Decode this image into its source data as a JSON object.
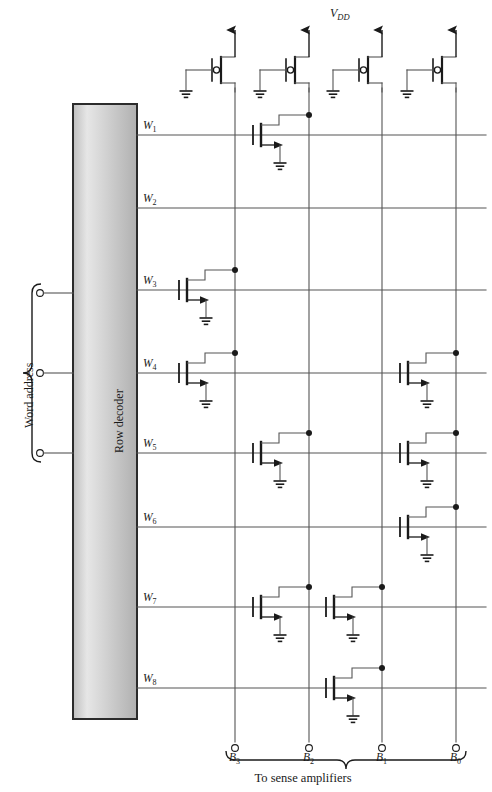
{
  "figure": {
    "type": "rom-array-schematic",
    "supply_label": "V",
    "supply_sub": "DD",
    "row_decoder_label": "Row decoder",
    "word_address_label": "Word address",
    "sense_label": "To sense amplifiers"
  },
  "colors": {
    "wire": "#555555",
    "device": "#1a1a1a",
    "box_border": "#2b2b2b",
    "box_fill_light": "#e8e8e8",
    "box_fill_dark": "#b4b4b4",
    "background": "#ffffff"
  },
  "word_lines": [
    {
      "label": "W",
      "sub": "1",
      "y": 135
    },
    {
      "label": "W",
      "sub": "2",
      "y": 208
    },
    {
      "label": "W",
      "sub": "3",
      "y": 290
    },
    {
      "label": "W",
      "sub": "4",
      "y": 373
    },
    {
      "label": "W",
      "sub": "5",
      "y": 453
    },
    {
      "label": "W",
      "sub": "6",
      "y": 527
    },
    {
      "label": "W",
      "sub": "7",
      "y": 607
    },
    {
      "label": "W",
      "sub": "8",
      "y": 688
    }
  ],
  "bit_lines": [
    {
      "label": "B",
      "sub": "3",
      "x": 235
    },
    {
      "label": "B",
      "sub": "2",
      "x": 309
    },
    {
      "label": "B",
      "sub": "1",
      "x": 382
    },
    {
      "label": "B",
      "sub": "0",
      "x": 456
    }
  ],
  "pmos_loads": [
    {
      "name": "pmos-load-b3",
      "x": 235
    },
    {
      "name": "pmos-load-b2",
      "x": 309
    },
    {
      "name": "pmos-load-b1",
      "x": 382
    },
    {
      "name": "pmos-load-b0",
      "x": 456
    }
  ],
  "word_address_terminals": [
    {
      "y": 293
    },
    {
      "y": 373
    },
    {
      "y": 453
    }
  ],
  "rom_cells": [
    {
      "word": 1,
      "bit": 2,
      "wl_y": 135,
      "bl_x": 309
    },
    {
      "word": 3,
      "bit": 3,
      "wl_y": 290,
      "bl_x": 235
    },
    {
      "word": 4,
      "bit": 3,
      "wl_y": 373,
      "bl_x": 235
    },
    {
      "word": 4,
      "bit": 0,
      "wl_y": 373,
      "bl_x": 456
    },
    {
      "word": 5,
      "bit": 2,
      "wl_y": 453,
      "bl_x": 309
    },
    {
      "word": 5,
      "bit": 0,
      "wl_y": 453,
      "bl_x": 456
    },
    {
      "word": 6,
      "bit": 0,
      "wl_y": 527,
      "bl_x": 456
    },
    {
      "word": 7,
      "bit": 2,
      "wl_y": 607,
      "bl_x": 309
    },
    {
      "word": 7,
      "bit": 1,
      "wl_y": 607,
      "bl_x": 382
    },
    {
      "word": 8,
      "bit": 1,
      "wl_y": 688,
      "bl_x": 382
    }
  ]
}
